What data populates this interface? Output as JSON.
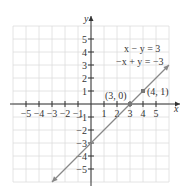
{
  "chart_data": {
    "type": "line",
    "title": "",
    "xlabel": "x",
    "ylabel": "y",
    "xlim": [
      -6,
      6
    ],
    "ylim": [
      -6,
      6
    ],
    "grid": true,
    "x_ticks": [
      "-5",
      "-4",
      "-3",
      "-2",
      "-1",
      "1",
      "2",
      "3",
      "4",
      "5"
    ],
    "y_ticks": [
      "5",
      "4",
      "3",
      "2",
      "1",
      "-1",
      "-2",
      "-3",
      "-4",
      "-5"
    ],
    "equations": [
      "x − y = 3",
      "−x + y = −3"
    ],
    "series": [
      {
        "name": "x − y = 3 / −x + y = −3",
        "x": [
          -3,
          6
        ],
        "y": [
          -6,
          3
        ]
      }
    ],
    "points": [
      {
        "label": "(3, 0)",
        "x": 3,
        "y": 0
      },
      {
        "label": "(4, 1)",
        "x": 4,
        "y": 1
      }
    ],
    "colors": {
      "line": "#888888",
      "grid": "#dddddd",
      "axis": "#333333"
    }
  }
}
